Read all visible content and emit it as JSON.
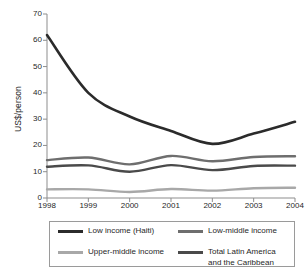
{
  "chart_data": {
    "type": "line",
    "title": "",
    "xlabel": "",
    "ylabel": "US$/person",
    "x": [
      1998,
      1999,
      2000,
      2001,
      2002,
      2003,
      2004
    ],
    "xticklabels": [
      "1998",
      "1999",
      "2000",
      "2001",
      "2002",
      "2003",
      "2004"
    ],
    "yticks": [
      0,
      10,
      20,
      30,
      40,
      50,
      60,
      70
    ],
    "yticklabels": [
      "0",
      "10",
      "20",
      "30",
      "40",
      "50",
      "60",
      "70"
    ],
    "ylim": [
      0,
      70
    ],
    "xlim": [
      1998,
      2004
    ],
    "grid": false,
    "legend_position": "below-plot",
    "series": [
      {
        "name": "Low income (Haiti)",
        "color": "#2b2b2b",
        "width": 2.6,
        "values": [
          62.0,
          40.0,
          31.0,
          25.5,
          20.6,
          24.5,
          29.0
        ]
      },
      {
        "name": "Low-middle income",
        "color": "#6e6e6e",
        "width": 2.4,
        "values": [
          14.4,
          15.4,
          12.8,
          16.0,
          14.0,
          15.6,
          15.9
        ]
      },
      {
        "name": "Upper-middle income",
        "color": "#a8a8a8",
        "width": 2.4,
        "values": [
          3.3,
          3.3,
          2.3,
          3.4,
          2.8,
          3.7,
          3.9
        ]
      },
      {
        "name": "Total Latin America and the Caribbean",
        "color": "#4a4a4a",
        "width": 2.4,
        "values": [
          11.9,
          12.4,
          10.0,
          12.5,
          10.6,
          12.2,
          12.3
        ]
      }
    ]
  },
  "axis": {
    "y_title": "US$/person",
    "y_labels": [
      "70",
      "60",
      "50",
      "40",
      "30",
      "20",
      "10",
      "0"
    ],
    "x_labels": [
      "1998",
      "1999",
      "2000",
      "2001",
      "2002",
      "2003",
      "2004"
    ]
  },
  "legend": {
    "entries": [
      {
        "label": "Low income (Haiti)",
        "color": "#2b2b2b",
        "name": "legend-low-income-haiti"
      },
      {
        "label": "Low-middle income",
        "color": "#6e6e6e",
        "name": "legend-low-middle-income"
      },
      {
        "label": "Upper-middle income",
        "color": "#a8a8a8",
        "name": "legend-upper-middle-income"
      },
      {
        "label": "Total Latin America\nand the Caribbean",
        "color": "#4a4a4a",
        "name": "legend-total-lac"
      }
    ]
  },
  "colors": {
    "axis": "#8d8d8d",
    "text": "#1f1f1f",
    "legend_border": "#9a9a9a",
    "background": "#ffffff"
  }
}
